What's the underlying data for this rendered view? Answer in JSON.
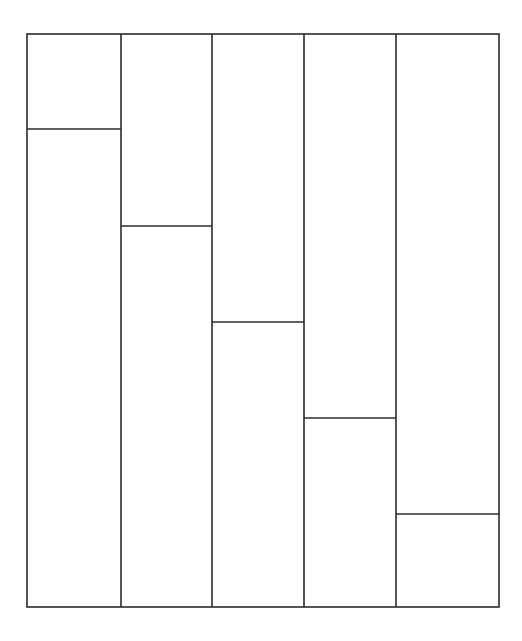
{
  "diagram": {
    "stroke_color": "#2b2b2b",
    "background": "#ffffff",
    "outer_rect": {
      "x1": 27,
      "y1": 34,
      "x2": 499,
      "y2": 607
    },
    "columns": [
      {
        "x1": 27,
        "x2": 121,
        "split_y": 129
      },
      {
        "x1": 121,
        "x2": 212,
        "split_y": 226
      },
      {
        "x1": 212,
        "x2": 304,
        "split_y": 322
      },
      {
        "x1": 304,
        "x2": 396,
        "split_y": 418
      },
      {
        "x1": 396,
        "x2": 499,
        "split_y": 514
      }
    ]
  }
}
